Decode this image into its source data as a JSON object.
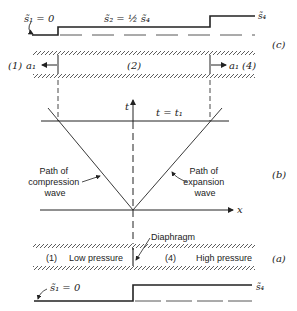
{
  "figure": {
    "panel_c": {
      "label": "(c)",
      "entropy_left_label": "s̃₁ = 0",
      "entropy_mid_label": "s̃₂ = ½ s̃₄",
      "entropy_right_label": "s̃₄",
      "region_left": "(1)",
      "region_left_speed": "a₁",
      "region_mid": "(2)",
      "region_right_speed": "a₁",
      "region_right": "(4)"
    },
    "panel_b": {
      "label": "(b)",
      "t_axis_label": "t",
      "x_axis_label": "x",
      "time_line_label": "t = t₁",
      "compression_label": [
        "Path of",
        "compression",
        "wave"
      ],
      "expansion_label": [
        "Path of",
        "expansion",
        "wave"
      ]
    },
    "panel_a": {
      "label": "(a)",
      "diaphragm_label": "Diaphragm",
      "region_left_num": "(1)",
      "region_left_text": "Low pressure",
      "region_right_num": "(4)",
      "region_right_text": "High pressure",
      "entropy_left_label": "s̃₁ = 0",
      "entropy_right_label": "s̃₄"
    }
  }
}
